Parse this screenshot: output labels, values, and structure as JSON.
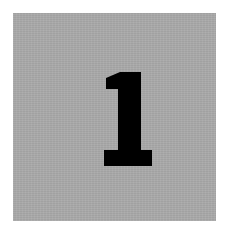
{
  "tile": {
    "numeral": "1",
    "background_color": "#a9a9a9",
    "numeral_color": "#000000",
    "border_color": "#ffffff"
  }
}
